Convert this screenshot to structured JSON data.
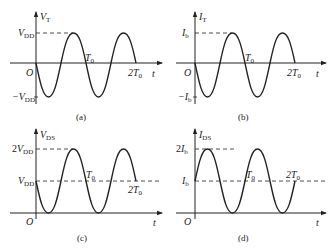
{
  "figure": {
    "panels": [
      {
        "id": "a",
        "caption": "(a)",
        "y_axis_label": "V",
        "y_axis_sub": "T",
        "x_axis_label": "t",
        "origin_label": "O",
        "upper_level_label": "V",
        "upper_level_sub": "DD",
        "upper_level_prefix": "",
        "lower_level_label": "V",
        "lower_level_sub": "DD",
        "lower_level_prefix": "−",
        "mid_tick_label": "T",
        "mid_tick_sub": "0",
        "end_tick_label": "2T",
        "end_tick_sub": "0"
      },
      {
        "id": "b",
        "caption": "(b)",
        "y_axis_label": "I",
        "y_axis_sub": "T",
        "x_axis_label": "t",
        "origin_label": "O",
        "upper_level_label": "I",
        "upper_level_sub": "b",
        "upper_level_prefix": "",
        "lower_level_label": "I",
        "lower_level_sub": "b",
        "lower_level_prefix": "−",
        "mid_tick_label": "T",
        "mid_tick_sub": "0",
        "end_tick_label": "2T",
        "end_tick_sub": "0"
      },
      {
        "id": "c",
        "caption": "(c)",
        "y_axis_label": "V",
        "y_axis_sub": "DS",
        "x_axis_label": "t",
        "origin_label": "O",
        "upper_level_prefix": "2",
        "upper_level_label": "V",
        "upper_level_sub": "DD",
        "mid_level_label": "V",
        "mid_level_sub": "DD",
        "mid_tick_label": "T",
        "mid_tick_sub": "0",
        "end_tick_label": "2T",
        "end_tick_sub": "0"
      },
      {
        "id": "d",
        "caption": "(d)",
        "y_axis_label": "I",
        "y_axis_sub": "DS",
        "x_axis_label": "t",
        "origin_label": "O",
        "upper_level_prefix": "2",
        "upper_level_label": "I",
        "upper_level_sub": "b",
        "mid_level_label": "I",
        "mid_level_sub": "b",
        "mid_tick_label": "T",
        "mid_tick_sub": "0",
        "end_tick_label": "2T",
        "end_tick_sub": "0"
      }
    ]
  },
  "colors": {
    "stroke": "#222222",
    "background": "#ffffff"
  }
}
